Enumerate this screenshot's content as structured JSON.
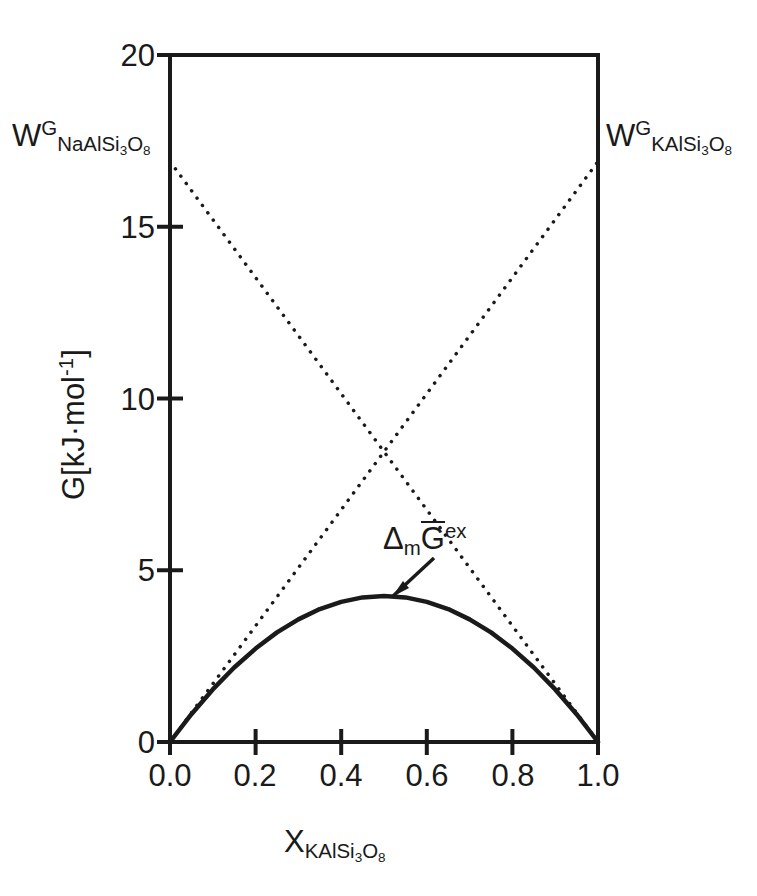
{
  "chart_data": {
    "type": "line",
    "title": "",
    "xlabel": "X_KAlSi3O8",
    "ylabel": "G[kJ·mol⁻¹]",
    "xlim": [
      0.0,
      1.0
    ],
    "ylim": [
      0,
      20
    ],
    "grid": false,
    "legend_position": "none",
    "xticks": [
      "0.0",
      "0.2",
      "0.4",
      "0.6",
      "0.8",
      "1.0"
    ],
    "xtick_values": [
      0.0,
      0.2,
      0.4,
      0.6,
      0.8,
      1.0
    ],
    "yticks": [
      "0",
      "5",
      "10",
      "15",
      "20"
    ],
    "ytick_values": [
      0,
      5,
      10,
      15,
      20
    ],
    "series": [
      {
        "name": "Δm G-bar ex",
        "style": "solid",
        "linewidth": 4.5,
        "color": "#1a1a1a",
        "x": [
          0.0,
          0.05,
          0.1,
          0.15,
          0.2,
          0.25,
          0.3,
          0.35,
          0.4,
          0.45,
          0.5,
          0.55,
          0.6,
          0.65,
          0.7,
          0.75,
          0.8,
          0.85,
          0.9,
          0.95,
          1.0
        ],
        "values": [
          0.0,
          0.81,
          1.53,
          2.17,
          2.72,
          3.19,
          3.57,
          3.87,
          4.08,
          4.21,
          4.25,
          4.21,
          4.08,
          3.87,
          3.57,
          3.19,
          2.72,
          2.17,
          1.53,
          0.81,
          0.0
        ]
      },
      {
        "name": "W_NaAlSi3O8 asymptote",
        "style": "dotted",
        "linewidth": 3.5,
        "color": "#1a1a1a",
        "x": [
          0.0,
          1.0
        ],
        "values": [
          16.9,
          0.0
        ]
      },
      {
        "name": "W_KAlSi3O8 asymptote",
        "style": "dotted",
        "linewidth": 3.5,
        "color": "#1a1a1a",
        "x": [
          0.0,
          1.0
        ],
        "values": [
          0.0,
          16.9
        ]
      }
    ],
    "annotations": [
      {
        "name": "W-NaAlSi3O8-label",
        "text": "W^G_NaAlSi3O8",
        "x": 0.0,
        "y": 16.9
      },
      {
        "name": "W-KAlSi3O8-label",
        "text": "W^G_KAlSi3O8",
        "x": 1.0,
        "y": 16.9
      },
      {
        "name": "excess-gibbs-label",
        "text": "Δm G̅ ex",
        "x": 0.55,
        "y": 5.4,
        "points_to": [
          0.5,
          4.3
        ]
      }
    ],
    "intersection": {
      "x": 0.5,
      "y": 8.45
    }
  },
  "axes": {
    "y_title": {
      "G": "G",
      "bracket_open": "[kJ·mol",
      "exponent": "-1",
      "bracket_close": "]"
    },
    "x_title": {
      "symbol": "X",
      "subscript": "KAlSi",
      "sub_num_3": "3",
      "sub_O": "O",
      "sub_num_8": "8"
    },
    "ytick_labels": [
      "20",
      "15",
      "10",
      "5",
      "0"
    ],
    "xtick_labels": [
      "0.0",
      "0.2",
      "0.4",
      "0.6",
      "0.8",
      "1.0"
    ]
  },
  "labels": {
    "w_left": {
      "symbol": "W",
      "superscript": "G",
      "sub_a": "NaAlSi",
      "sub_3": "3",
      "sub_O": "O",
      "sub_8": "8"
    },
    "w_right": {
      "symbol": "W",
      "superscript": "G",
      "sub_a": "KAlSi",
      "sub_3": "3",
      "sub_O": "O",
      "sub_8": "8"
    },
    "curve_annotation": {
      "delta": "Δ",
      "delta_sub": "m",
      "g_bar": "G",
      "superscript": "ex"
    }
  },
  "style": {
    "axis_color": "#1a1a1a",
    "curve_color": "#1a1a1a",
    "background": "#ffffff"
  }
}
